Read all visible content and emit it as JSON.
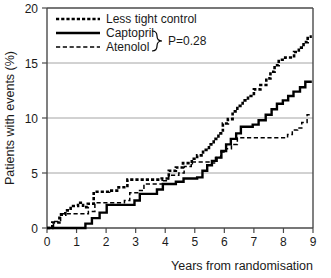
{
  "chart_data": {
    "type": "line",
    "title": "",
    "xlabel": "Years from randomisation",
    "ylabel": "Patients with events (%)",
    "xlim": [
      0,
      9
    ],
    "ylim": [
      0,
      20
    ],
    "xticks": [
      0,
      1,
      2,
      3,
      4,
      5,
      6,
      7,
      8,
      9
    ],
    "yticks": [
      0,
      5,
      10,
      15,
      20
    ],
    "grid": "horizontal",
    "legend_position": "top-left",
    "annotation": "P=0.28",
    "series": [
      {
        "name": "Less tight control",
        "style": "thick-dotted",
        "color": "#000000",
        "points": [
          [
            0.0,
            0.0
          ],
          [
            0.18,
            0.0
          ],
          [
            0.18,
            0.5
          ],
          [
            0.42,
            0.5
          ],
          [
            0.42,
            1.2
          ],
          [
            0.62,
            1.2
          ],
          [
            0.62,
            1.6
          ],
          [
            0.8,
            1.6
          ],
          [
            0.8,
            2.0
          ],
          [
            1.05,
            2.0
          ],
          [
            1.05,
            2.3
          ],
          [
            1.22,
            2.3
          ],
          [
            1.22,
            1.9
          ],
          [
            1.38,
            1.9
          ],
          [
            1.38,
            2.2
          ],
          [
            1.58,
            2.2
          ],
          [
            1.58,
            3.3
          ],
          [
            2.1,
            3.3
          ],
          [
            2.1,
            3.4
          ],
          [
            2.42,
            3.4
          ],
          [
            2.42,
            3.7
          ],
          [
            2.72,
            3.7
          ],
          [
            2.72,
            4.4
          ],
          [
            3.88,
            4.4
          ],
          [
            3.88,
            4.5
          ],
          [
            4.12,
            4.5
          ],
          [
            4.12,
            5.2
          ],
          [
            4.36,
            5.2
          ],
          [
            4.36,
            5.5
          ],
          [
            4.6,
            5.5
          ],
          [
            4.6,
            5.9
          ],
          [
            4.9,
            5.9
          ],
          [
            4.9,
            6.3
          ],
          [
            5.08,
            6.3
          ],
          [
            5.08,
            6.6
          ],
          [
            5.28,
            6.6
          ],
          [
            5.28,
            7.1
          ],
          [
            5.48,
            7.1
          ],
          [
            5.48,
            7.6
          ],
          [
            5.64,
            7.6
          ],
          [
            5.64,
            8.1
          ],
          [
            5.8,
            8.1
          ],
          [
            5.8,
            8.6
          ],
          [
            5.95,
            8.6
          ],
          [
            5.95,
            9.5
          ],
          [
            6.12,
            9.5
          ],
          [
            6.12,
            9.9
          ],
          [
            6.28,
            9.9
          ],
          [
            6.28,
            10.6
          ],
          [
            6.44,
            10.6
          ],
          [
            6.44,
            11.1
          ],
          [
            6.62,
            11.1
          ],
          [
            6.62,
            11.6
          ],
          [
            6.8,
            11.6
          ],
          [
            6.8,
            12.0
          ],
          [
            7.0,
            12.0
          ],
          [
            7.0,
            12.6
          ],
          [
            7.22,
            12.6
          ],
          [
            7.22,
            13.0
          ],
          [
            7.42,
            13.0
          ],
          [
            7.42,
            13.6
          ],
          [
            7.56,
            13.6
          ],
          [
            7.56,
            14.2
          ],
          [
            7.7,
            14.2
          ],
          [
            7.7,
            14.8
          ],
          [
            7.84,
            14.8
          ],
          [
            7.84,
            15.3
          ],
          [
            8.06,
            15.3
          ],
          [
            8.06,
            15.5
          ],
          [
            8.36,
            15.5
          ],
          [
            8.36,
            16.0
          ],
          [
            8.52,
            16.0
          ],
          [
            8.52,
            16.4
          ],
          [
            8.68,
            16.4
          ],
          [
            8.68,
            16.9
          ],
          [
            8.82,
            16.9
          ],
          [
            8.82,
            17.4
          ],
          [
            8.96,
            17.4
          ]
        ]
      },
      {
        "name": "Captopril",
        "style": "thick-solid",
        "color": "#000000",
        "points": [
          [
            0.0,
            0.0
          ],
          [
            1.3,
            0.0
          ],
          [
            1.3,
            0.4
          ],
          [
            1.52,
            0.4
          ],
          [
            1.52,
            0.9
          ],
          [
            1.78,
            0.9
          ],
          [
            1.78,
            1.4
          ],
          [
            2.02,
            1.4
          ],
          [
            2.02,
            2.1
          ],
          [
            2.96,
            2.1
          ],
          [
            2.96,
            2.5
          ],
          [
            3.14,
            2.5
          ],
          [
            3.14,
            3.1
          ],
          [
            3.72,
            3.1
          ],
          [
            3.72,
            3.5
          ],
          [
            3.92,
            3.5
          ],
          [
            3.92,
            4.0
          ],
          [
            4.36,
            4.0
          ],
          [
            4.36,
            4.2
          ],
          [
            4.62,
            4.2
          ],
          [
            4.62,
            4.5
          ],
          [
            5.08,
            4.5
          ],
          [
            5.08,
            4.6
          ],
          [
            5.26,
            4.6
          ],
          [
            5.26,
            5.2
          ],
          [
            5.42,
            5.2
          ],
          [
            5.42,
            5.7
          ],
          [
            5.58,
            5.7
          ],
          [
            5.58,
            6.1
          ],
          [
            5.74,
            6.1
          ],
          [
            5.74,
            6.4
          ],
          [
            5.9,
            6.4
          ],
          [
            5.9,
            7.0
          ],
          [
            6.06,
            7.0
          ],
          [
            6.06,
            7.6
          ],
          [
            6.22,
            7.6
          ],
          [
            6.22,
            8.1
          ],
          [
            6.4,
            8.1
          ],
          [
            6.4,
            8.6
          ],
          [
            6.56,
            8.6
          ],
          [
            6.56,
            9.2
          ],
          [
            6.96,
            9.2
          ],
          [
            6.96,
            9.4
          ],
          [
            7.16,
            9.4
          ],
          [
            7.16,
            9.8
          ],
          [
            7.4,
            9.8
          ],
          [
            7.4,
            10.3
          ],
          [
            7.6,
            10.3
          ],
          [
            7.6,
            10.8
          ],
          [
            7.78,
            10.8
          ],
          [
            7.78,
            11.3
          ],
          [
            7.98,
            11.3
          ],
          [
            7.98,
            11.6
          ],
          [
            8.16,
            11.6
          ],
          [
            8.16,
            12.0
          ],
          [
            8.34,
            12.0
          ],
          [
            8.34,
            12.4
          ],
          [
            8.56,
            12.4
          ],
          [
            8.56,
            12.8
          ],
          [
            8.74,
            12.8
          ],
          [
            8.74,
            13.3
          ],
          [
            8.96,
            13.3
          ]
        ]
      },
      {
        "name": "Atenolol",
        "style": "thin-dashed",
        "color": "#000000",
        "points": [
          [
            0.0,
            0.0
          ],
          [
            0.22,
            0.0
          ],
          [
            0.22,
            0.6
          ],
          [
            0.46,
            0.6
          ],
          [
            0.46,
            1.3
          ],
          [
            1.4,
            1.3
          ],
          [
            1.4,
            1.5
          ],
          [
            1.62,
            1.5
          ],
          [
            1.62,
            2.3
          ],
          [
            2.62,
            2.3
          ],
          [
            2.62,
            2.5
          ],
          [
            2.8,
            2.5
          ],
          [
            2.8,
            3.2
          ],
          [
            3.1,
            3.2
          ],
          [
            3.1,
            3.4
          ],
          [
            3.28,
            3.4
          ],
          [
            3.28,
            4.0
          ],
          [
            3.92,
            4.0
          ],
          [
            3.92,
            4.3
          ],
          [
            4.12,
            4.3
          ],
          [
            4.12,
            4.8
          ],
          [
            4.46,
            4.8
          ],
          [
            4.46,
            5.0
          ],
          [
            4.64,
            5.0
          ],
          [
            4.64,
            5.6
          ],
          [
            4.88,
            5.6
          ],
          [
            4.88,
            6.0
          ],
          [
            5.48,
            6.0
          ],
          [
            5.48,
            5.9
          ],
          [
            5.7,
            5.9
          ],
          [
            5.7,
            6.4
          ],
          [
            5.88,
            6.4
          ],
          [
            5.88,
            6.9
          ],
          [
            6.06,
            6.9
          ],
          [
            6.06,
            7.2
          ],
          [
            6.24,
            7.2
          ],
          [
            6.24,
            7.6
          ],
          [
            6.44,
            7.6
          ],
          [
            6.44,
            8.2
          ],
          [
            8.14,
            8.2
          ],
          [
            8.14,
            8.5
          ],
          [
            8.3,
            8.5
          ],
          [
            8.3,
            8.9
          ],
          [
            8.48,
            8.9
          ],
          [
            8.48,
            9.1
          ],
          [
            8.62,
            9.1
          ],
          [
            8.62,
            9.6
          ],
          [
            8.8,
            9.6
          ],
          [
            8.8,
            10.3
          ],
          [
            8.96,
            10.3
          ]
        ]
      }
    ]
  },
  "legend": {
    "items": [
      {
        "label": "Less tight control",
        "style": "thick-dotted"
      },
      {
        "label": "Captopril",
        "style": "thick-solid"
      },
      {
        "label": "Atenolol",
        "style": "thin-dashed"
      }
    ],
    "pvalue": "P=0.28"
  },
  "axes": {
    "x_title": "Years from randomisation",
    "y_title": "Patients with events (%)",
    "x_tick_labels": [
      "0",
      "1",
      "2",
      "3",
      "4",
      "5",
      "6",
      "7",
      "8",
      "9"
    ],
    "y_tick_labels": [
      "0",
      "5",
      "10",
      "15",
      "20"
    ]
  },
  "colors": {
    "curve": "#000000",
    "grid": "#9a9a9a",
    "axis": "#4a4a4a",
    "text": "#1a1a1a",
    "background": "#ffffff"
  }
}
